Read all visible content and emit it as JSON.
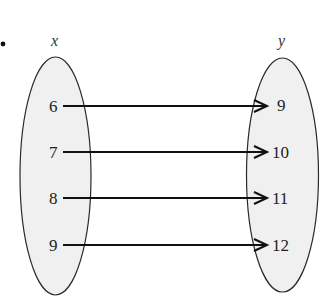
{
  "diagram": {
    "type": "mapping",
    "bullet": "•",
    "domain": {
      "label": "x",
      "values": [
        "6",
        "7",
        "8",
        "9"
      ]
    },
    "range": {
      "label": "y",
      "values": [
        "9",
        "10",
        "11",
        "12"
      ]
    },
    "mappings": [
      {
        "from": "6",
        "to": "9"
      },
      {
        "from": "7",
        "to": "10"
      },
      {
        "from": "8",
        "to": "11"
      },
      {
        "from": "9",
        "to": "12"
      }
    ],
    "colors": {
      "ellipse_fill": "#f0f0f0",
      "ellipse_stroke": "#2a2a2a",
      "arrow": "#111111",
      "text": "#222222"
    }
  }
}
